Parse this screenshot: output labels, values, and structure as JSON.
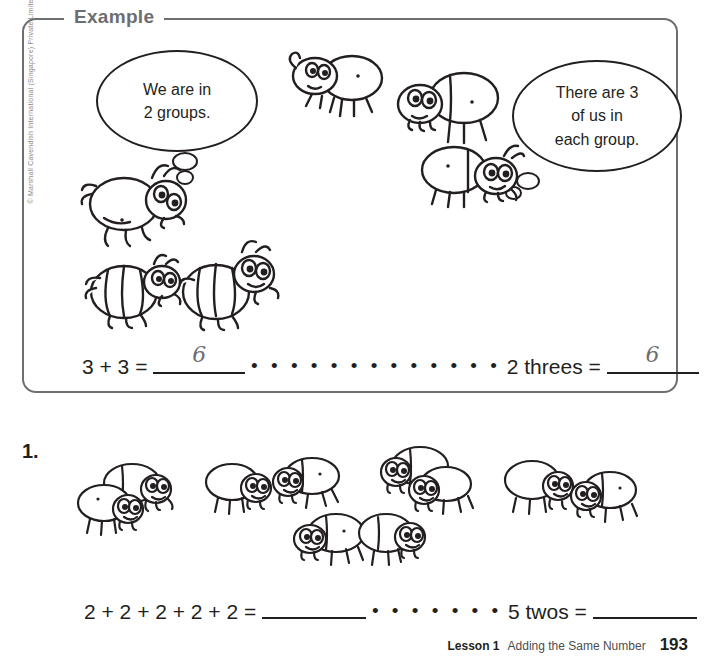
{
  "copyright": "© Marshall Cavendish International (Singapore) Private Limited",
  "example": {
    "label": "Example",
    "bubble_left": "We are in 2 groups.",
    "bubble_left_line1": "We are in",
    "bubble_left_line2": "2 groups.",
    "bubble_right_line1": "There are 3",
    "bubble_right_line2": "of us in",
    "bubble_right_line3": "each group.",
    "equation_left": "3 + 3  =",
    "answer_left": "6",
    "leader": "• • • • • • • • • • • • •",
    "equation_right": "2 threes =",
    "answer_right": "6",
    "groups": 2,
    "per_group": 3
  },
  "question1": {
    "number": "1.",
    "equation_left": "2 + 2 + 2 + 2 + 2 =",
    "answer_left": "",
    "leader": "• • • • • • •",
    "equation_right": "5 twos =",
    "answer_right": "",
    "groups": 5,
    "per_group": 2
  },
  "footer": {
    "lesson": "Lesson 1",
    "title": "Adding the Same Number",
    "page": "193"
  },
  "colors": {
    "ink": "#231f20",
    "box_border": "#6d6e71",
    "handwriting": "#6d6e71"
  }
}
